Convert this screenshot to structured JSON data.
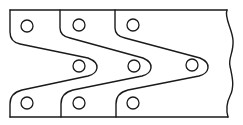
{
  "diagram": {
    "title": "",
    "plate_count": 3,
    "holes": {
      "top_row": 3,
      "middle_row": 3,
      "bottom_row": 3,
      "total": 9
    },
    "edge_style": {
      "right": "wavy-break-line"
    },
    "colors": {
      "line": "#1a1a1a",
      "background": "#ffffff"
    }
  }
}
